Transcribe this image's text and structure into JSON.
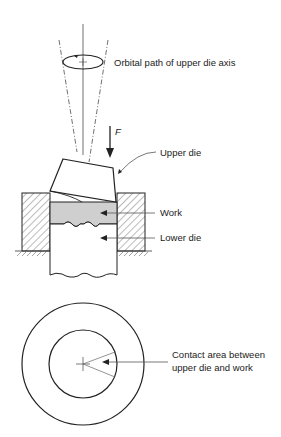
{
  "diagram": {
    "labels": {
      "orbital_path": "Orbital path of upper die axis",
      "force": "F",
      "upper_die": "Upper die",
      "work": "Work",
      "lower_die": "Lower die",
      "contact_line1": "Contact area between",
      "contact_line2": "upper die and work"
    },
    "colors": {
      "line": "#222222",
      "work_fill": "#cfcfcf",
      "background": "#ffffff"
    }
  }
}
